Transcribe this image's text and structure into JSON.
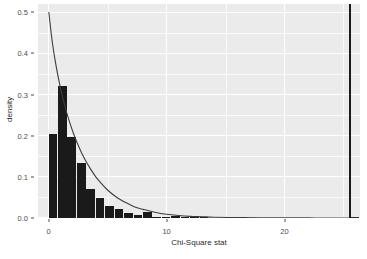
{
  "chart_data": {
    "type": "bar",
    "title": "",
    "subtitle": "",
    "xlabel": "Chi-Square stat",
    "ylabel": "density",
    "xlim": [
      -0.9,
      26.4
    ],
    "ylim": [
      0.0,
      0.52
    ],
    "xticks": [
      0,
      10,
      20
    ],
    "xtick_labels": [
      "0",
      "10",
      "20"
    ],
    "yticks": [
      0.0,
      0.1,
      0.2,
      0.3,
      0.4,
      0.5
    ],
    "ytick_labels": [
      "0.0",
      "0.1",
      "0.2",
      "0.3",
      "0.4",
      "0.5"
    ],
    "grid": true,
    "legend": "none",
    "bin_width": 0.8,
    "bar_color": "#1a1a1a",
    "panel_color": "#ebebeb",
    "grid_color": "#ffffff",
    "curve_color": "#3d3d3d",
    "bins": [
      {
        "x_left": 0.0,
        "x_right": 0.8,
        "density": 0.205
      },
      {
        "x_left": 0.8,
        "x_right": 1.6,
        "density": 0.32
      },
      {
        "x_left": 1.6,
        "x_right": 2.4,
        "density": 0.196
      },
      {
        "x_left": 2.4,
        "x_right": 3.2,
        "density": 0.134
      },
      {
        "x_left": 3.2,
        "x_right": 4.0,
        "density": 0.071
      },
      {
        "x_left": 4.0,
        "x_right": 4.8,
        "density": 0.049
      },
      {
        "x_left": 4.8,
        "x_right": 5.6,
        "density": 0.03
      },
      {
        "x_left": 5.6,
        "x_right": 6.4,
        "density": 0.022
      },
      {
        "x_left": 6.4,
        "x_right": 7.2,
        "density": 0.013
      },
      {
        "x_left": 7.2,
        "x_right": 8.0,
        "density": 0.008
      },
      {
        "x_left": 8.0,
        "x_right": 8.8,
        "density": 0.014
      },
      {
        "x_left": 8.8,
        "x_right": 9.6,
        "density": 0.003
      },
      {
        "x_left": 9.6,
        "x_right": 10.4,
        "density": 0.002
      },
      {
        "x_left": 10.4,
        "x_right": 11.2,
        "density": 0.004
      },
      {
        "x_left": 11.2,
        "x_right": 12.0,
        "density": 0.003
      },
      {
        "x_left": 12.0,
        "x_right": 12.8,
        "density": 0.002
      },
      {
        "x_left": 12.8,
        "x_right": 13.6,
        "density": 0.001
      },
      {
        "x_left": 16.0,
        "x_right": 16.8,
        "density": 0.001
      },
      {
        "x_left": 25.6,
        "x_right": 26.4,
        "density": 0.002
      }
    ],
    "density_curve": [
      {
        "x": 0.02,
        "y": 0.5
      },
      {
        "x": 0.3,
        "y": 0.43
      },
      {
        "x": 0.6,
        "y": 0.375
      },
      {
        "x": 0.9,
        "y": 0.33
      },
      {
        "x": 1.2,
        "y": 0.292
      },
      {
        "x": 1.5,
        "y": 0.259
      },
      {
        "x": 1.8,
        "y": 0.231
      },
      {
        "x": 2.1,
        "y": 0.206
      },
      {
        "x": 2.4,
        "y": 0.184
      },
      {
        "x": 2.8,
        "y": 0.158
      },
      {
        "x": 3.2,
        "y": 0.136
      },
      {
        "x": 3.6,
        "y": 0.117
      },
      {
        "x": 4.0,
        "y": 0.1
      },
      {
        "x": 4.5,
        "y": 0.083
      },
      {
        "x": 5.0,
        "y": 0.068
      },
      {
        "x": 5.5,
        "y": 0.056
      },
      {
        "x": 6.0,
        "y": 0.046
      },
      {
        "x": 6.5,
        "y": 0.038
      },
      {
        "x": 7.0,
        "y": 0.031
      },
      {
        "x": 7.5,
        "y": 0.025
      },
      {
        "x": 8.0,
        "y": 0.021
      },
      {
        "x": 9.0,
        "y": 0.014
      },
      {
        "x": 10.0,
        "y": 0.009
      },
      {
        "x": 11.0,
        "y": 0.006
      },
      {
        "x": 12.0,
        "y": 0.004
      },
      {
        "x": 13.0,
        "y": 0.003
      },
      {
        "x": 14.0,
        "y": 0.002
      },
      {
        "x": 16.0,
        "y": 0.001
      },
      {
        "x": 18.0,
        "y": 0.0006
      },
      {
        "x": 20.0,
        "y": 0.0003
      },
      {
        "x": 22.0,
        "y": 0.0002
      },
      {
        "x": 24.0,
        "y": 0.0001
      },
      {
        "x": 26.3,
        "y": 0.0001
      }
    ],
    "reference_line": {
      "x": 25.55,
      "color": "#1a1a1a",
      "width_px": 2
    }
  }
}
